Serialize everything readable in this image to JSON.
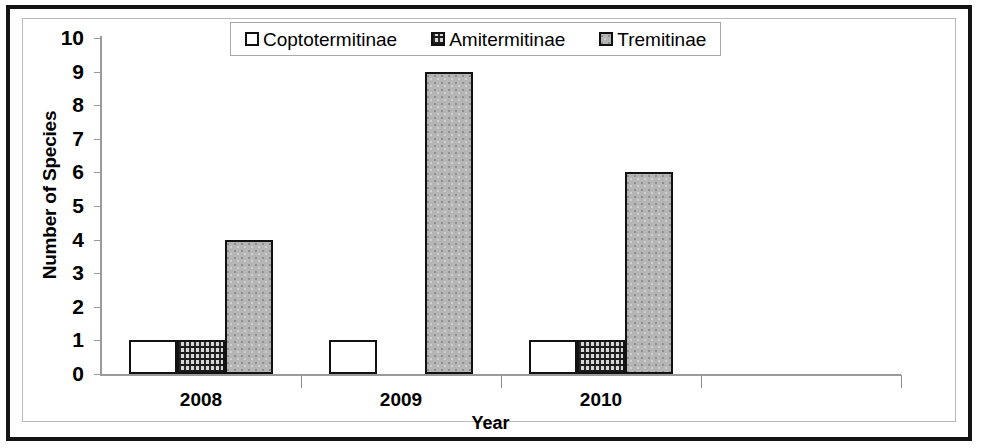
{
  "chart_data": {
    "type": "bar",
    "title": "",
    "xlabel": "Year",
    "ylabel": "Number of Species",
    "categories": [
      "2008",
      "2009",
      "2010",
      ""
    ],
    "ylim": [
      0,
      10
    ],
    "ytick_labels": [
      "10",
      "9",
      "8",
      "7",
      "6",
      "5",
      "4",
      "3",
      "2",
      "1",
      "0"
    ],
    "ytick_values": [
      10,
      9,
      8,
      7,
      6,
      5,
      4,
      3,
      2,
      1,
      0
    ],
    "grid": false,
    "legend_position": "top-center",
    "series": [
      {
        "name": "Coptotermitinae",
        "values": [
          1,
          1,
          1,
          0
        ],
        "fill": "white-speckle",
        "color": "#ffffff"
      },
      {
        "name": "Amitermitinae",
        "values": [
          1,
          0,
          1,
          0
        ],
        "fill": "dark-crosshatch",
        "color": "#3c3c3c"
      },
      {
        "name": "Tremitinae",
        "values": [
          4,
          9,
          6,
          0
        ],
        "fill": "gray-solid",
        "color": "#b5b5b5"
      }
    ]
  },
  "legend": {
    "items": [
      {
        "label": "Coptotermitinae"
      },
      {
        "label": "Amitermitinae"
      },
      {
        "label": "Tremitinae"
      }
    ]
  },
  "axes": {
    "y_title": "Number of Species",
    "x_title": "Year"
  },
  "colors": {
    "frame": "#141414",
    "axis": "#9a9a9a",
    "bar_outline": "#121212",
    "series_1": "#ffffff",
    "series_2": "#3c3c3c",
    "series_3": "#b5b5b5",
    "background": "#ffffff"
  }
}
